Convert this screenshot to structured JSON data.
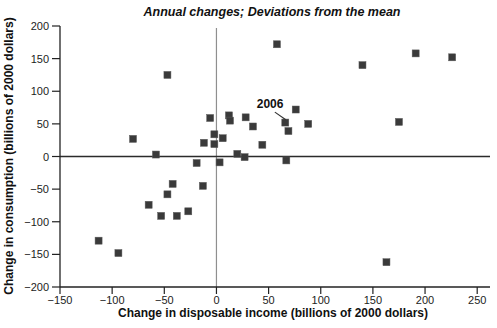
{
  "chart_data": {
    "type": "scatter",
    "title": "Annual changes; Deviations from the mean",
    "xlabel": "Change in disposable income (billions of 2000 dollars)",
    "ylabel": "Change in consumption (billions of 2000 dollars)",
    "xlim": [
      -150,
      250
    ],
    "ylim": [
      -200,
      200
    ],
    "xticks": [
      -150,
      -100,
      -50,
      0,
      50,
      100,
      150,
      200,
      250
    ],
    "xtick_labels": [
      "−150",
      "−100",
      "−50",
      "0",
      "50",
      "100",
      "150",
      "200",
      "250"
    ],
    "yticks": [
      -200,
      -150,
      -100,
      -50,
      0,
      50,
      100,
      150,
      200
    ],
    "ytick_labels": [
      "−200",
      "−150",
      "−100",
      "−50",
      "0",
      "50",
      "100",
      "150",
      "200"
    ],
    "grid": false,
    "legend": null,
    "reference_lines": {
      "vertical_at_x": 0,
      "horizontal_at_y": 0
    },
    "marker": {
      "shape": "square",
      "color": "#3a3a3a",
      "size": 7
    },
    "points": [
      [
        -113,
        -129
      ],
      [
        -94,
        -148
      ],
      [
        -80,
        27
      ],
      [
        -65,
        -74
      ],
      [
        -58,
        3
      ],
      [
        -53,
        -91
      ],
      [
        -47,
        -58
      ],
      [
        -47,
        125
      ],
      [
        -42,
        -42
      ],
      [
        -38,
        -91
      ],
      [
        -27,
        -84
      ],
      [
        -19,
        -10
      ],
      [
        -13,
        -45
      ],
      [
        -12,
        21
      ],
      [
        -6,
        59
      ],
      [
        -2,
        34
      ],
      [
        -2,
        19
      ],
      [
        3,
        -9
      ],
      [
        6,
        28
      ],
      [
        12,
        63
      ],
      [
        13,
        55
      ],
      [
        20,
        4
      ],
      [
        27,
        -1
      ],
      [
        28,
        60
      ],
      [
        35,
        46
      ],
      [
        44,
        18
      ],
      [
        58,
        172
      ],
      [
        66,
        52
      ],
      [
        69,
        39
      ],
      [
        67,
        -6
      ],
      [
        76,
        72
      ],
      [
        88,
        50
      ],
      [
        140,
        140
      ],
      [
        163,
        -162
      ],
      [
        175,
        53
      ],
      [
        191,
        158
      ],
      [
        226,
        152
      ]
    ],
    "annotation": {
      "label": "2006",
      "label_pos": [
        51.4,
        80.4
      ],
      "line_start": [
        56,
        68
      ],
      "line_end": [
        66.5,
        56.5
      ],
      "target_point": [
        66,
        52
      ]
    }
  }
}
